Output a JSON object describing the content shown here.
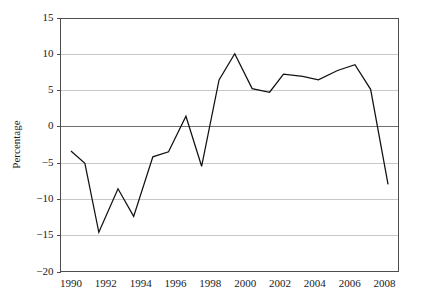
{
  "chart_data": {
    "type": "line",
    "title": "",
    "subtitle": "",
    "xlabel": "",
    "ylabel": "Percentage",
    "xlim": [
      1989.4,
      2008.8
    ],
    "ylim": [
      -20,
      15
    ],
    "grid": true,
    "grid_axis": "y",
    "legend": "none",
    "zero_line": true,
    "y_ticks": [
      15,
      10,
      5,
      0,
      -5,
      -10,
      -15,
      -20
    ],
    "y_tick_labels": [
      "15",
      "10",
      "5",
      "0",
      "−5",
      "−10",
      "−15",
      "−20"
    ],
    "x_ticks": [
      1990,
      1992,
      1994,
      1996,
      1998,
      2000,
      2002,
      2004,
      2006,
      2008
    ],
    "x_tick_labels": [
      "1990",
      "1992",
      "1994",
      "1996",
      "1998",
      "2000",
      "2002",
      "2004",
      "2006",
      "2008"
    ],
    "series": [
      {
        "name": "Percentage",
        "color": "#111111",
        "x": [
          1990.0,
          1990.8,
          1991.6,
          1992.7,
          1993.6,
          1994.7,
          1995.6,
          1996.6,
          1997.5,
          1998.5,
          1999.4,
          2000.4,
          2001.4,
          2002.2,
          2003.3,
          2004.2,
          2005.3,
          2006.3,
          2007.2,
          2008.2
        ],
        "values": [
          -3.4,
          -5.1,
          -14.6,
          -8.6,
          -12.4,
          -4.2,
          -3.5,
          1.4,
          -5.5,
          6.4,
          10.0,
          5.2,
          4.7,
          7.2,
          6.9,
          6.4,
          7.7,
          8.5,
          5.1,
          -8.0
        ]
      }
    ]
  },
  "figure": {
    "background_color": "#ffffff",
    "line_color": "#111111",
    "grid_color": "#c8c8c8",
    "axis_color": "#4d4d4d",
    "zero_line_color": "#6e6e6e"
  }
}
